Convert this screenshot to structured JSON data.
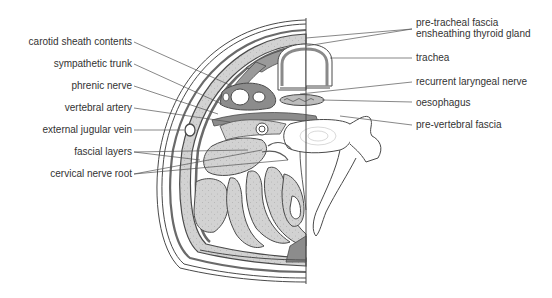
{
  "figure": {
    "colors": {
      "stroke": "#4a4a4a",
      "muscle_fill": "#cfcfcf",
      "fascia_fill": "#8c8c8c",
      "bone_fill": "#ffffff",
      "text": "#333333",
      "leader": "#555555"
    }
  },
  "labels": {
    "left": [
      {
        "text": "carotid sheath contents"
      },
      {
        "text": "sympathetic trunk"
      },
      {
        "text": "phrenic nerve"
      },
      {
        "text": "vertebral artery"
      },
      {
        "text": "external jugular vein"
      },
      {
        "text": "fascial layers"
      },
      {
        "text": "cervical nerve root"
      }
    ],
    "right": [
      {
        "text": "pre-tracheal fascia",
        "text2": "ensheathing thyroid gland"
      },
      {
        "text": "trachea"
      },
      {
        "text": "recurrent laryngeal nerve"
      },
      {
        "text": "oesophagus"
      },
      {
        "text": "pre-vertebral fascia"
      }
    ]
  }
}
